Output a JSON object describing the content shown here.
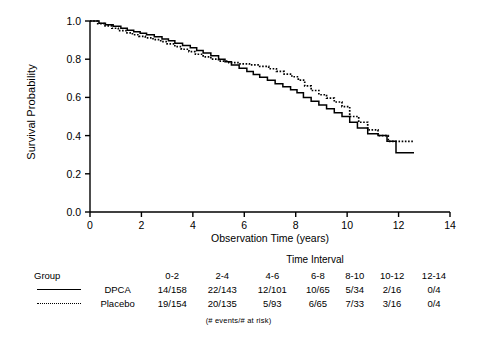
{
  "chart_data": {
    "type": "line",
    "title": "",
    "xlabel": "Observation Time (years)",
    "ylabel": "Survival Probability",
    "xlim": [
      0,
      14
    ],
    "ylim": [
      0.0,
      1.0
    ],
    "xticks": [
      "0",
      "2",
      "4",
      "6",
      "8",
      "10",
      "12",
      "14"
    ],
    "yticks": [
      "0.0",
      "0.2",
      "0.4",
      "0.6",
      "0.8",
      "1.0"
    ],
    "grid": false,
    "legend_position": "below-plot-table",
    "series": [
      {
        "name": "DPCA",
        "style": "solid",
        "color": "#000000",
        "points": [
          [
            0.0,
            1.0
          ],
          [
            0.35,
            0.988
          ],
          [
            0.6,
            0.98
          ],
          [
            0.9,
            0.972
          ],
          [
            1.2,
            0.962
          ],
          [
            1.45,
            0.952
          ],
          [
            1.7,
            0.944
          ],
          [
            1.95,
            0.936
          ],
          [
            2.2,
            0.928
          ],
          [
            2.5,
            0.918
          ],
          [
            2.8,
            0.906
          ],
          [
            3.05,
            0.896
          ],
          [
            3.3,
            0.884
          ],
          [
            3.6,
            0.872
          ],
          [
            3.9,
            0.86
          ],
          [
            4.15,
            0.846
          ],
          [
            4.4,
            0.832
          ],
          [
            4.7,
            0.818
          ],
          [
            5.0,
            0.8
          ],
          [
            5.25,
            0.786
          ],
          [
            5.5,
            0.77
          ],
          [
            5.8,
            0.752
          ],
          [
            6.1,
            0.736
          ],
          [
            6.35,
            0.72
          ],
          [
            6.6,
            0.706
          ],
          [
            6.9,
            0.69
          ],
          [
            7.2,
            0.672
          ],
          [
            7.5,
            0.656
          ],
          [
            7.8,
            0.64
          ],
          [
            8.05,
            0.624
          ],
          [
            8.3,
            0.6
          ],
          [
            8.6,
            0.58
          ],
          [
            8.9,
            0.56
          ],
          [
            9.2,
            0.54
          ],
          [
            9.5,
            0.52
          ],
          [
            9.8,
            0.5
          ],
          [
            10.1,
            0.47
          ],
          [
            10.4,
            0.44
          ],
          [
            10.8,
            0.41
          ],
          [
            11.2,
            0.4
          ],
          [
            11.55,
            0.37
          ],
          [
            11.9,
            0.31
          ],
          [
            12.6,
            0.31
          ]
        ]
      },
      {
        "name": "Placebo",
        "style": "dotted",
        "color": "#000000",
        "points": [
          [
            0.0,
            1.0
          ],
          [
            0.3,
            0.986
          ],
          [
            0.55,
            0.974
          ],
          [
            0.85,
            0.962
          ],
          [
            1.1,
            0.95
          ],
          [
            1.4,
            0.938
          ],
          [
            1.65,
            0.928
          ],
          [
            1.9,
            0.92
          ],
          [
            2.15,
            0.912
          ],
          [
            2.45,
            0.902
          ],
          [
            2.75,
            0.892
          ],
          [
            3.0,
            0.88
          ],
          [
            3.3,
            0.866
          ],
          [
            3.55,
            0.852
          ],
          [
            3.85,
            0.84
          ],
          [
            4.1,
            0.826
          ],
          [
            4.4,
            0.812
          ],
          [
            4.7,
            0.8
          ],
          [
            5.0,
            0.79
          ],
          [
            5.4,
            0.782
          ],
          [
            5.8,
            0.776
          ],
          [
            6.2,
            0.77
          ],
          [
            6.6,
            0.762
          ],
          [
            6.95,
            0.75
          ],
          [
            7.25,
            0.736
          ],
          [
            7.55,
            0.722
          ],
          [
            7.85,
            0.708
          ],
          [
            8.1,
            0.69
          ],
          [
            8.35,
            0.66
          ],
          [
            8.6,
            0.636
          ],
          [
            8.9,
            0.614
          ],
          [
            9.2,
            0.596
          ],
          [
            9.5,
            0.576
          ],
          [
            9.8,
            0.552
          ],
          [
            10.1,
            0.5
          ],
          [
            10.45,
            0.47
          ],
          [
            10.8,
            0.43
          ],
          [
            11.2,
            0.4
          ],
          [
            11.6,
            0.37
          ],
          [
            12.6,
            0.37
          ]
        ]
      }
    ]
  },
  "risk_table": {
    "time_interval_header": "Time Interval",
    "group_header": "Group",
    "intervals": [
      "0-2",
      "2-4",
      "4-6",
      "6-8",
      "8-10",
      "10-12",
      "12-14"
    ],
    "rows": [
      {
        "group": "DPCA",
        "line_style": "solid",
        "values": [
          "14/158",
          "22/143",
          "12/101",
          "10/65",
          "5/34",
          "2/16",
          "0/4"
        ]
      },
      {
        "group": "Placebo",
        "line_style": "dotted",
        "values": [
          "19/154",
          "20/135",
          "5/93",
          "6/65",
          "7/33",
          "3/16",
          "0/4"
        ]
      }
    ],
    "footnote": "(# events/# at risk)"
  }
}
